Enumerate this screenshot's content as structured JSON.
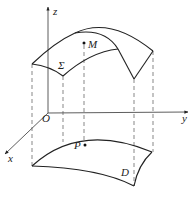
{
  "diagram": {
    "type": "3d-surface-projection",
    "axes": {
      "x": {
        "label": "x"
      },
      "y": {
        "label": "y"
      },
      "z": {
        "label": "z"
      },
      "origin": {
        "label": "O"
      }
    },
    "surface": {
      "label": "Σ"
    },
    "point_on_surface": {
      "label": "M"
    },
    "projection_region": {
      "label": "D"
    },
    "projected_point": {
      "label": "P"
    },
    "colors": {
      "line": "#222222",
      "dashed": "#555555",
      "background": "#ffffff"
    }
  }
}
